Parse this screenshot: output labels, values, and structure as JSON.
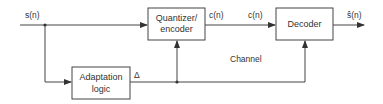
{
  "diagram": {
    "input_label": "s(n)",
    "output_label": "ŝ(n)",
    "blocks": {
      "quantizer": [
        "Quantizer/",
        "encoder"
      ],
      "decoder": [
        "Decoder"
      ],
      "adaptation": [
        "Adaptation",
        "logic"
      ]
    },
    "signals": {
      "code_out": "c(n)",
      "code_in": "c(n)",
      "step": "Δ",
      "channel": "Channel"
    }
  }
}
